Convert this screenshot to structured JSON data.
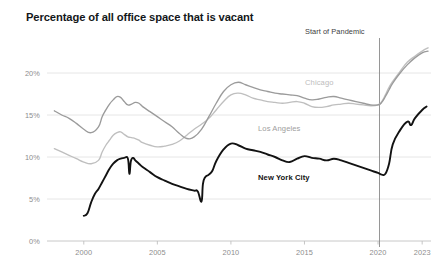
{
  "chart_data": {
    "type": "line",
    "title": "Percentage of all office space that is vacant",
    "xlabel": "",
    "ylabel": "",
    "xlim": [
      1997.5,
      2023.6
    ],
    "ylim": [
      0,
      24
    ],
    "grid": true,
    "legend_position": "inline-labels",
    "x_ticks": [
      "2000",
      "2005",
      "2010",
      "2015",
      "2020",
      "2023"
    ],
    "x_tick_values": [
      2000,
      2005,
      2010,
      2015,
      2020,
      2023
    ],
    "y_ticks": [
      "0%",
      "5%",
      "10%",
      "15%",
      "20%"
    ],
    "y_tick_values": [
      0,
      5,
      10,
      15,
      20
    ],
    "annotations": [
      {
        "text": "Start of Pandemic",
        "x": 2020.1,
        "type": "vertical-rule"
      }
    ],
    "series": [
      {
        "name": "Chicago",
        "color": "#bfbfbf",
        "label_x": 2014.8,
        "label_y": 18.6,
        "x": [
          1998.0,
          1998.5,
          1999.0,
          1999.5,
          2000.0,
          2000.5,
          2001.0,
          2001.25,
          2001.5,
          2001.75,
          2002.0,
          2002.25,
          2002.5,
          2002.75,
          2003.0,
          2003.25,
          2003.5,
          2003.75,
          2004.0,
          2004.5,
          2005.0,
          2005.5,
          2006.0,
          2006.5,
          2007.0,
          2007.5,
          2008.0,
          2008.5,
          2009.0,
          2009.5,
          2010.0,
          2010.5,
          2011.0,
          2011.5,
          2012.0,
          2012.5,
          2013.0,
          2013.5,
          2014.0,
          2014.5,
          2015.0,
          2015.5,
          2016.0,
          2016.5,
          2017.0,
          2017.5,
          2018.0,
          2018.5,
          2019.0,
          2019.5,
          2020.0,
          2020.25,
          2020.5,
          2020.75,
          2021.0,
          2021.5,
          2022.0,
          2022.5,
          2023.0,
          2023.4
        ],
        "values": [
          11.0,
          10.6,
          10.2,
          9.8,
          9.4,
          9.2,
          9.6,
          10.6,
          11.4,
          12.0,
          12.6,
          12.9,
          13.0,
          12.7,
          12.4,
          12.3,
          12.2,
          12.0,
          11.7,
          11.4,
          11.2,
          11.3,
          11.5,
          11.9,
          12.6,
          13.3,
          13.9,
          14.6,
          15.6,
          16.6,
          17.4,
          17.6,
          17.4,
          17.0,
          16.8,
          16.6,
          16.5,
          16.4,
          16.5,
          16.6,
          16.4,
          16.0,
          15.9,
          16.0,
          16.2,
          16.3,
          16.4,
          16.3,
          16.2,
          16.1,
          16.2,
          16.6,
          17.4,
          18.3,
          19.0,
          20.2,
          21.3,
          22.0,
          22.6,
          23.0
        ]
      },
      {
        "name": "Los Angeles",
        "color": "#9b9b9b",
        "label_x": 2010.8,
        "label_y": 13.9,
        "x": [
          1998.0,
          1998.5,
          1999.0,
          1999.5,
          2000.0,
          2000.5,
          2001.0,
          2001.25,
          2001.5,
          2001.75,
          2002.0,
          2002.25,
          2002.5,
          2002.75,
          2003.0,
          2003.25,
          2003.5,
          2003.75,
          2004.0,
          2004.5,
          2005.0,
          2005.5,
          2006.0,
          2006.5,
          2007.0,
          2007.5,
          2008.0,
          2008.5,
          2009.0,
          2009.5,
          2010.0,
          2010.5,
          2011.0,
          2011.5,
          2012.0,
          2012.5,
          2013.0,
          2013.5,
          2014.0,
          2014.5,
          2015.0,
          2015.5,
          2016.0,
          2016.5,
          2017.0,
          2017.5,
          2018.0,
          2018.5,
          2019.0,
          2019.5,
          2020.0,
          2020.25,
          2020.5,
          2020.75,
          2021.0,
          2021.5,
          2022.0,
          2022.5,
          2023.0,
          2023.4
        ],
        "values": [
          15.5,
          15.0,
          14.6,
          14.0,
          13.3,
          12.9,
          13.6,
          14.8,
          15.6,
          16.3,
          16.8,
          17.2,
          17.1,
          16.6,
          16.2,
          16.3,
          16.5,
          16.4,
          16.0,
          15.4,
          14.8,
          14.2,
          13.6,
          12.8,
          12.2,
          12.4,
          13.3,
          14.8,
          16.4,
          17.8,
          18.6,
          18.9,
          18.6,
          18.3,
          18.0,
          17.8,
          17.6,
          17.5,
          17.4,
          17.3,
          17.0,
          16.8,
          16.9,
          17.1,
          17.2,
          17.0,
          16.8,
          16.6,
          16.4,
          16.2,
          16.2,
          16.5,
          17.2,
          18.0,
          18.8,
          20.0,
          21.0,
          21.8,
          22.4,
          22.6
        ]
      },
      {
        "name": "New York City",
        "color": "#121212",
        "label_x": 2010.6,
        "label_y": 10.2,
        "x": [
          2000.0,
          2000.25,
          2000.5,
          2000.75,
          2001.0,
          2001.25,
          2001.5,
          2001.75,
          2002.0,
          2002.25,
          2002.5,
          2002.75,
          2003.0,
          2003.1,
          2003.2,
          2003.35,
          2003.5,
          2003.75,
          2004.0,
          2004.5,
          2005.0,
          2005.5,
          2006.0,
          2006.5,
          2007.0,
          2007.5,
          2007.75,
          2008.0,
          2008.1,
          2008.25,
          2008.5,
          2008.75,
          2009.0,
          2009.5,
          2010.0,
          2010.5,
          2011.0,
          2011.5,
          2012.0,
          2012.5,
          2013.0,
          2013.5,
          2014.0,
          2014.5,
          2015.0,
          2015.5,
          2016.0,
          2016.5,
          2017.0,
          2017.5,
          2018.0,
          2018.5,
          2019.0,
          2019.5,
          2020.0,
          2020.25,
          2020.5,
          2020.75,
          2021.0,
          2021.5,
          2022.0,
          2022.25,
          2022.5,
          2023.0,
          2023.3
        ],
        "values": [
          3.0,
          3.3,
          4.6,
          5.6,
          6.2,
          7.0,
          7.8,
          8.6,
          9.2,
          9.6,
          9.8,
          9.9,
          9.8,
          8.0,
          9.5,
          9.9,
          9.6,
          9.2,
          8.8,
          8.2,
          7.6,
          7.2,
          6.8,
          6.5,
          6.2,
          6.0,
          5.9,
          4.7,
          6.8,
          7.6,
          7.9,
          8.4,
          9.5,
          10.9,
          11.6,
          11.4,
          11.0,
          10.8,
          10.6,
          10.3,
          10.0,
          9.6,
          9.4,
          9.8,
          10.1,
          9.9,
          9.8,
          9.6,
          9.8,
          9.6,
          9.3,
          9.0,
          8.7,
          8.4,
          8.1,
          7.9,
          8.0,
          9.2,
          11.5,
          13.2,
          14.2,
          13.8,
          14.6,
          15.6,
          16.0
        ]
      }
    ]
  },
  "axes": {
    "y_labels": [
      "20%",
      "15%",
      "10%",
      "5%",
      "0%"
    ],
    "x_labels": [
      "2000",
      "2005",
      "2010",
      "2015",
      "2020",
      "2023"
    ]
  },
  "labels": {
    "chicago": "Chicago",
    "los_angeles": "Los Angeles",
    "new_york_city": "New  York City",
    "pandemic": "Start of Pandemic"
  }
}
